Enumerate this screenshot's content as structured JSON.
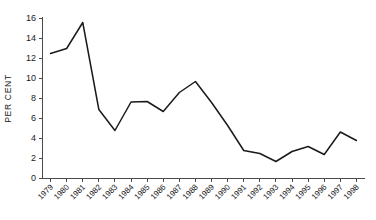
{
  "chart_data": {
    "type": "line",
    "title": "",
    "subtitle": "",
    "xlabel": "",
    "ylabel": "PER CENT",
    "ylim": [
      0,
      16
    ],
    "yticks": [
      0,
      2,
      4,
      6,
      8,
      10,
      12,
      14,
      16
    ],
    "ytick_labels": [
      "0",
      "2",
      "4",
      "6",
      "8",
      "10",
      "12",
      "14",
      "16"
    ],
    "grid": false,
    "legend": false,
    "legend_position": "none",
    "line_color": "#1a1a1a",
    "axis_color": "#4a4a4a",
    "categories": [
      "1979",
      "1980",
      "1981",
      "1982",
      "1983",
      "1984",
      "1985",
      "1986",
      "1987",
      "1988",
      "1989",
      "1990",
      "1991",
      "1992",
      "1993",
      "1994",
      "1995",
      "1996",
      "1997",
      "1998"
    ],
    "values": [
      12.5,
      13.0,
      15.6,
      6.9,
      4.8,
      7.65,
      7.7,
      6.7,
      8.6,
      9.7,
      7.6,
      5.3,
      2.8,
      2.5,
      1.7,
      2.7,
      3.2,
      2.4,
      4.65,
      3.8
    ],
    "series": [
      {
        "name": "",
        "values": [
          12.5,
          13.0,
          15.6,
          6.9,
          4.8,
          7.65,
          7.7,
          6.7,
          8.6,
          9.7,
          7.6,
          5.3,
          2.8,
          2.5,
          1.7,
          2.7,
          3.2,
          2.4,
          4.65,
          3.8
        ]
      }
    ]
  }
}
